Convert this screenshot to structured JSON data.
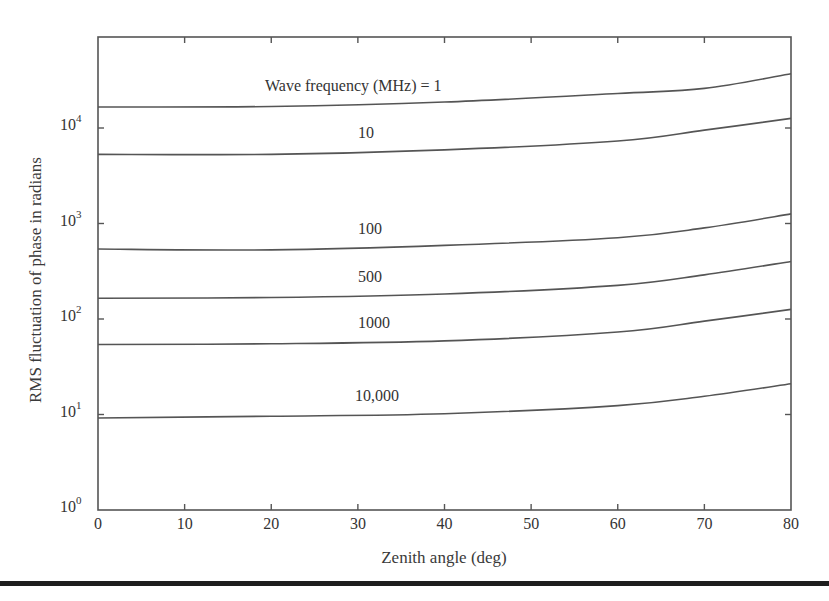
{
  "chart_data": {
    "type": "line",
    "title": "",
    "xlabel": "Zenith angle (deg)",
    "ylabel": "RMS fluctuation of phase in radians",
    "yscale": "log",
    "xlim": [
      0,
      80
    ],
    "ylim": [
      1,
      100000
    ],
    "grid": false,
    "legend": "inline curve labels",
    "x_ticks": [
      "0",
      "10",
      "20",
      "30",
      "40",
      "50",
      "60",
      "70",
      "80"
    ],
    "y_ticks": [
      {
        "base": "10",
        "exp": "0"
      },
      {
        "base": "10",
        "exp": "1"
      },
      {
        "base": "10",
        "exp": "2"
      },
      {
        "base": "10",
        "exp": "3"
      },
      {
        "base": "10",
        "exp": "4"
      }
    ],
    "x": [
      0,
      20,
      40,
      60,
      70,
      80
    ],
    "series": [
      {
        "name": "1",
        "label": "Wave frequency (MHz) = 1",
        "values": [
          16600,
          16800,
          18700,
          23000,
          26000,
          37000
        ]
      },
      {
        "name": "10",
        "label": "10",
        "values": [
          5300,
          5300,
          5900,
          7300,
          9500,
          12600
        ]
      },
      {
        "name": "100",
        "label": "100",
        "values": [
          540,
          530,
          590,
          710,
          900,
          1260
        ]
      },
      {
        "name": "500",
        "label": "500",
        "values": [
          165,
          168,
          183,
          225,
          290,
          400
        ]
      },
      {
        "name": "1000",
        "label": "1000",
        "values": [
          54,
          55,
          59,
          73,
          95,
          126
        ]
      },
      {
        "name": "10000",
        "label": "10,000",
        "values": [
          9.2,
          9.6,
          10.2,
          12.4,
          15.5,
          21
        ]
      }
    ],
    "annotations": [
      {
        "text": "Wave frequency (MHz) = 1",
        "near_series": "1"
      },
      {
        "text": "10",
        "near_series": "10"
      },
      {
        "text": "100",
        "near_series": "100"
      },
      {
        "text": "500",
        "near_series": "500"
      },
      {
        "text": "1000",
        "near_series": "1000"
      },
      {
        "text": "10,000",
        "near_series": "10000"
      }
    ],
    "colors": {
      "axes": "#555555",
      "lines": "#555555",
      "text": "#333333",
      "rule": "#1e1e1e"
    }
  }
}
